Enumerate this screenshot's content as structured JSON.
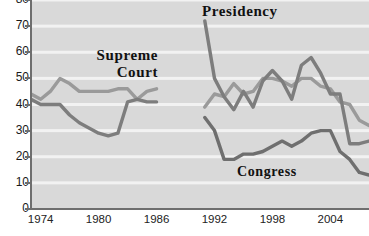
{
  "chart_data": {
    "type": "line",
    "title": "",
    "xlabel": "",
    "ylabel": "",
    "xlim": [
      1973,
      2008
    ],
    "ylim": [
      0,
      80
    ],
    "grid": true,
    "grid_axis": "y",
    "legend": "inline-annotations",
    "ytick_labels": [
      "0",
      "10",
      "20",
      "30",
      "40",
      "50",
      "60",
      "70",
      "80"
    ],
    "yticks": [
      0,
      10,
      20,
      30,
      40,
      50,
      60,
      70,
      80
    ],
    "xtick_labels": [
      "1974",
      "1980",
      "1986",
      "1992",
      "1998",
      "2004"
    ],
    "xticks": [
      1974,
      1980,
      1986,
      1992,
      1998,
      2004
    ],
    "data_gap_years": [
      1987,
      1988,
      1989,
      1990
    ],
    "series": [
      {
        "name": "Supreme Court",
        "color": "#9a9a9a",
        "x": [
          1973,
          1974,
          1975,
          1976,
          1977,
          1978,
          1979,
          1980,
          1981,
          1982,
          1983,
          1984,
          1985,
          1986,
          1991,
          1992,
          1993,
          1994,
          1995,
          1996,
          1997,
          1998,
          1999,
          2000,
          2001,
          2002,
          2003,
          2004,
          2005,
          2006,
          2007,
          2008
        ],
        "values": [
          44,
          42,
          45,
          50,
          48,
          45,
          45,
          45,
          45,
          46,
          46,
          42,
          45,
          46,
          39,
          44,
          43,
          48,
          44,
          45,
          50,
          50,
          49,
          47,
          50,
          50,
          47,
          46,
          41,
          40,
          34,
          32
        ]
      },
      {
        "name": "Presidency",
        "color": "#7d7d7d",
        "x": [
          1973,
          1974,
          1975,
          1976,
          1977,
          1978,
          1979,
          1980,
          1981,
          1982,
          1983,
          1984,
          1985,
          1986,
          1991,
          1992,
          1993,
          1994,
          1995,
          1996,
          1997,
          1998,
          1999,
          2000,
          2001,
          2002,
          2003,
          2004,
          2005,
          2006,
          2007,
          2008
        ],
        "values": [
          42,
          40,
          40,
          40,
          36,
          33,
          31,
          29,
          28,
          29,
          41,
          42,
          41,
          41,
          72,
          50,
          43,
          38,
          45,
          39,
          49,
          53,
          49,
          42,
          55,
          58,
          52,
          44,
          44,
          25,
          25,
          26
        ]
      },
      {
        "name": "Congress",
        "color": "#6f6f6f",
        "x": [
          1991,
          1992,
          1993,
          1994,
          1995,
          1996,
          1997,
          1998,
          1999,
          2000,
          2001,
          2002,
          2003,
          2004,
          2005,
          2006,
          2007,
          2008
        ],
        "values": [
          35,
          30,
          19,
          19,
          21,
          21,
          22,
          24,
          26,
          24,
          26,
          29,
          30,
          30,
          22,
          19,
          14,
          13
        ]
      }
    ]
  },
  "axis": {
    "y_labels": [
      "80",
      "70",
      "60",
      "50",
      "40",
      "30",
      "20",
      "10",
      "0"
    ],
    "x_labels": [
      "1974",
      "1980",
      "1986",
      "1992",
      "1998",
      "2004"
    ]
  },
  "annotations": {
    "supreme_court": "Supreme\nCourt",
    "supreme_court_line1": "Supreme",
    "supreme_court_line2": "Court",
    "presidency": "Presidency",
    "congress": "Congress"
  },
  "colors": {
    "plot_background": "#d9d9d9",
    "gridline": "#f2f2f2",
    "axis": "#6e6e6e",
    "supreme_court": "#9a9a9a",
    "presidency": "#7d7d7d",
    "congress": "#6f6f6f",
    "label_text": "#111111"
  }
}
